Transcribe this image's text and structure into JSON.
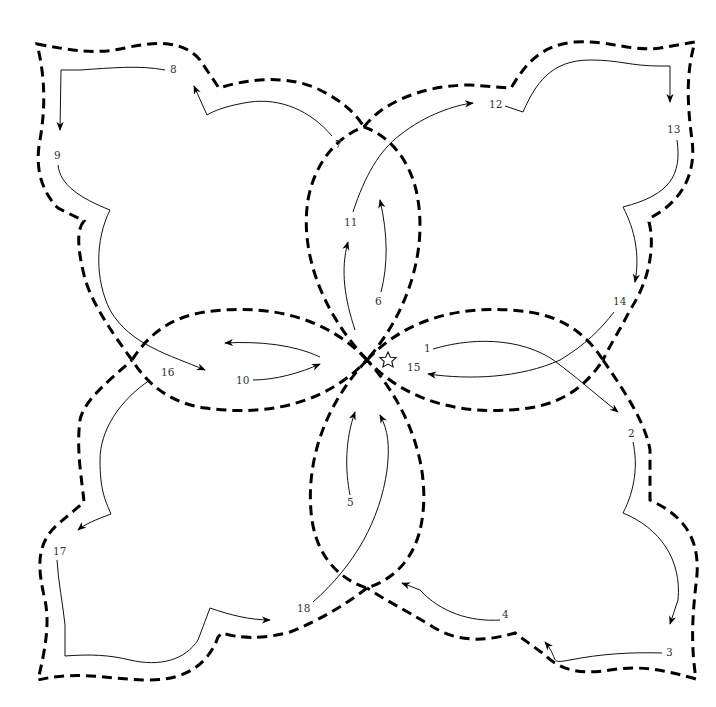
{
  "diagram": {
    "title": "",
    "start_marker": "star-icon",
    "colors": {
      "outline": "#000000",
      "stitch_path": "#111111",
      "label": "#333333",
      "background": "#ffffff"
    },
    "steps": [
      {
        "n": "1",
        "x": 424,
        "y": 352
      },
      {
        "n": "2",
        "x": 630,
        "y": 437
      },
      {
        "n": "3",
        "x": 668,
        "y": 656
      },
      {
        "n": "4",
        "x": 504,
        "y": 617
      },
      {
        "n": "5",
        "x": 349,
        "y": 505
      },
      {
        "n": "6",
        "x": 378,
        "y": 305
      },
      {
        "n": "7",
        "x": 338,
        "y": 148
      },
      {
        "n": "8",
        "x": 196,
        "y": 73
      },
      {
        "n": "9",
        "x": 57,
        "y": 159
      },
      {
        "n": "10",
        "x": 241,
        "y": 384
      },
      {
        "n": "11",
        "x": 350,
        "y": 226
      },
      {
        "n": "12",
        "x": 493,
        "y": 108
      },
      {
        "n": "13",
        "x": 673,
        "y": 133
      },
      {
        "n": "14",
        "x": 619,
        "y": 305
      },
      {
        "n": "15",
        "x": 412,
        "y": 370
      },
      {
        "n": "16",
        "x": 167,
        "y": 376
      },
      {
        "n": "17",
        "x": 58,
        "y": 555
      },
      {
        "n": "18",
        "x": 302,
        "y": 612
      }
    ]
  }
}
